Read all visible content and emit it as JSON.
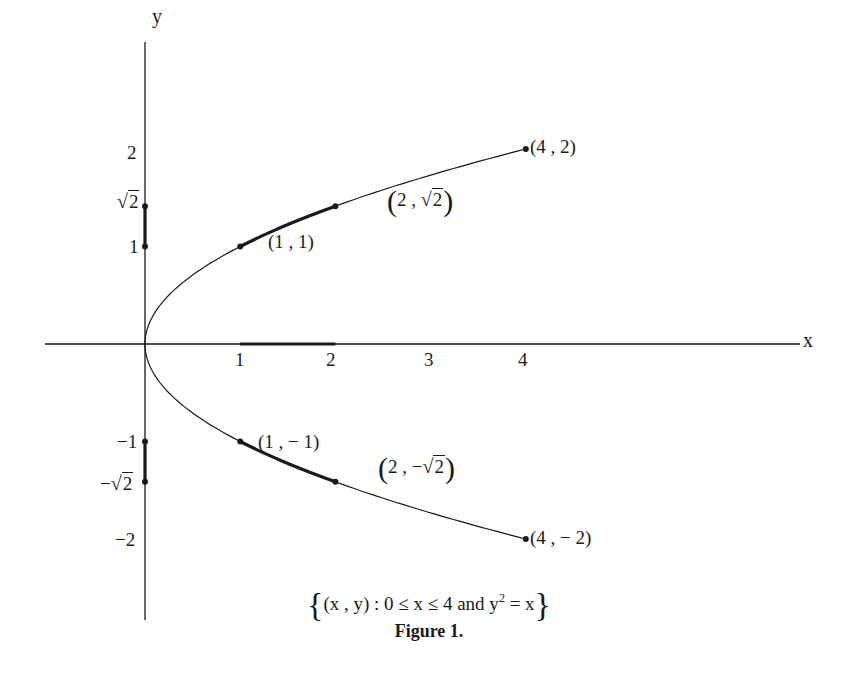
{
  "chart_data": {
    "type": "line",
    "title": "Figure 1.",
    "subtitle": "{(x, y) : 0 ≤ x ≤ 4 and y² = x}",
    "xlabel": "x",
    "ylabel": "y",
    "xlim": [
      -1.05,
      6.9
    ],
    "ylim": [
      -2.8,
      3.1
    ],
    "grid": false,
    "legend": null,
    "x_ticks": [
      "1",
      "2",
      "3",
      "4"
    ],
    "y_ticks": [
      "2",
      "√2",
      "1",
      "−1",
      "−√2",
      "−2"
    ],
    "series": [
      {
        "name": "upper branch y = √x",
        "x": [
          0,
          0.25,
          0.5,
          1,
          1.5,
          2,
          2.5,
          3,
          3.5,
          4
        ],
        "y": [
          0,
          0.5,
          0.707,
          1,
          1.225,
          1.414,
          1.581,
          1.732,
          1.871,
          2
        ]
      },
      {
        "name": "lower branch y = −√x",
        "x": [
          0,
          0.25,
          0.5,
          1,
          1.5,
          2,
          2.5,
          3,
          3.5,
          4
        ],
        "y": [
          0,
          -0.5,
          -0.707,
          -1,
          -1.225,
          -1.414,
          -1.581,
          -1.732,
          -1.871,
          -2
        ]
      }
    ],
    "highlighted_segments": [
      {
        "name": "curve arc upper",
        "from": [
          1,
          1
        ],
        "to": [
          2,
          1.414
        ]
      },
      {
        "name": "curve arc lower",
        "from": [
          1,
          -1
        ],
        "to": [
          2,
          -1.414
        ]
      },
      {
        "name": "x-axis interval",
        "from": [
          1,
          0
        ],
        "to": [
          2,
          0
        ]
      },
      {
        "name": "y-axis interval upper",
        "from": [
          0,
          1
        ],
        "to": [
          0,
          1.414
        ]
      },
      {
        "name": "y-axis interval lower",
        "from": [
          0,
          -1
        ],
        "to": [
          0,
          -1.414
        ]
      }
    ],
    "annotations": [
      {
        "text": "(4, 2)",
        "point": [
          4,
          2
        ]
      },
      {
        "text": "(2, √2)",
        "point": [
          2,
          1.414
        ]
      },
      {
        "text": "(1, 1)",
        "point": [
          1,
          1
        ]
      },
      {
        "text": "(1, −1)",
        "point": [
          1,
          -1
        ]
      },
      {
        "text": "(2, −√2)",
        "point": [
          2,
          -1.414
        ]
      },
      {
        "text": "(4, −2)",
        "point": [
          4,
          -2
        ]
      }
    ]
  },
  "labels": {
    "x_axis": "x",
    "y_axis": "y",
    "xt1": "1",
    "xt2": "2",
    "xt3": "3",
    "xt4": "4",
    "yt2": "2",
    "yt1": "1",
    "ytm1": "−1",
    "ytm2": "−2",
    "sqrt_num": "2",
    "neg_sign": "−",
    "pt_4_2": "(4 , 2)",
    "pt_1_1": "(1 , 1)",
    "pt_1_m1": "(1 , − 1)",
    "pt_4_m2": "(4 , − 2)",
    "pt_2_sqrt_prefix": "2 , ",
    "pt_2_msqrt_prefix": "2 , −",
    "set_open": "{",
    "set_close": "}",
    "set_body": "(x , y)  :  0 ≤ x ≤ 4 and y",
    "set_exp": "2",
    "set_tail": " = x",
    "figure_title": "Figure 1."
  },
  "colors": {
    "ink": "#1a1a1a",
    "background": "#ffffff"
  }
}
